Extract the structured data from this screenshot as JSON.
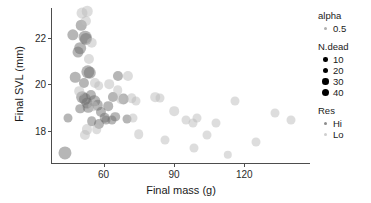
{
  "chart_data": {
    "type": "scatter",
    "title": "",
    "xlabel": "Final mass (g)",
    "ylabel": "Final SVL (mm)",
    "xlim": [
      38,
      148
    ],
    "ylim": [
      16.6,
      23.3
    ],
    "xticks": [
      60,
      90,
      120
    ],
    "yticks": [
      18,
      20,
      22
    ],
    "grid": false,
    "legend_position": "right",
    "point_color": "#7f7f7f",
    "alpha": 0.5,
    "encodings": {
      "size": "N.dead",
      "color": "Res"
    },
    "series": [
      {
        "name": "Hi",
        "color": "#6e6e6e",
        "points": [
          {
            "x": 47.0,
            "y": 22.15,
            "n": 18
          },
          {
            "x": 50.5,
            "y": 22.55,
            "n": 14
          },
          {
            "x": 52.0,
            "y": 22.05,
            "n": 26
          },
          {
            "x": 52.6,
            "y": 21.98,
            "n": 22
          },
          {
            "x": 50.0,
            "y": 21.55,
            "n": 20
          },
          {
            "x": 49.2,
            "y": 21.4,
            "n": 16
          },
          {
            "x": 48.0,
            "y": 20.3,
            "n": 14
          },
          {
            "x": 53.2,
            "y": 20.55,
            "n": 30
          },
          {
            "x": 54.0,
            "y": 20.5,
            "n": 24
          },
          {
            "x": 51.5,
            "y": 20.05,
            "n": 12
          },
          {
            "x": 51.0,
            "y": 19.45,
            "n": 20
          },
          {
            "x": 52.0,
            "y": 19.35,
            "n": 22
          },
          {
            "x": 52.8,
            "y": 19.2,
            "n": 16
          },
          {
            "x": 53.5,
            "y": 19.0,
            "n": 14
          },
          {
            "x": 50.0,
            "y": 18.95,
            "n": 10
          },
          {
            "x": 54.5,
            "y": 19.55,
            "n": 12
          },
          {
            "x": 56.0,
            "y": 19.3,
            "n": 18
          },
          {
            "x": 57.5,
            "y": 19.1,
            "n": 14
          },
          {
            "x": 59.0,
            "y": 18.8,
            "n": 12
          },
          {
            "x": 60.5,
            "y": 18.55,
            "n": 14
          },
          {
            "x": 62.0,
            "y": 19.05,
            "n": 10
          },
          {
            "x": 64.0,
            "y": 19.45,
            "n": 12
          },
          {
            "x": 66.0,
            "y": 20.35,
            "n": 12
          },
          {
            "x": 68.5,
            "y": 19.35,
            "n": 16
          },
          {
            "x": 65.0,
            "y": 18.6,
            "n": 10
          },
          {
            "x": 45.0,
            "y": 18.55,
            "n": 8
          },
          {
            "x": 43.5,
            "y": 17.05,
            "n": 28
          },
          {
            "x": 55.0,
            "y": 18.4,
            "n": 10
          },
          {
            "x": 58.0,
            "y": 18.3,
            "n": 12
          },
          {
            "x": 61.0,
            "y": 18.45,
            "n": 8
          },
          {
            "x": 63.5,
            "y": 18.45,
            "n": 8
          },
          {
            "x": 70.0,
            "y": 18.5,
            "n": 8
          }
        ]
      },
      {
        "name": "Lo",
        "color": "#bcbcbc",
        "points": [
          {
            "x": 51.0,
            "y": 23.1,
            "n": 16
          },
          {
            "x": 53.0,
            "y": 23.15,
            "n": 14
          },
          {
            "x": 52.5,
            "y": 22.75,
            "n": 12
          },
          {
            "x": 55.0,
            "y": 21.8,
            "n": 14
          },
          {
            "x": 53.8,
            "y": 21.1,
            "n": 12
          },
          {
            "x": 49.5,
            "y": 19.7,
            "n": 10
          },
          {
            "x": 56.5,
            "y": 20.05,
            "n": 12
          },
          {
            "x": 58.0,
            "y": 19.95,
            "n": 10
          },
          {
            "x": 55.5,
            "y": 19.05,
            "n": 10
          },
          {
            "x": 53.0,
            "y": 18.05,
            "n": 12
          },
          {
            "x": 52.2,
            "y": 17.8,
            "n": 12
          },
          {
            "x": 57.0,
            "y": 18.05,
            "n": 10
          },
          {
            "x": 62.5,
            "y": 20.0,
            "n": 10
          },
          {
            "x": 66.0,
            "y": 19.75,
            "n": 10
          },
          {
            "x": 67.5,
            "y": 19.35,
            "n": 10
          },
          {
            "x": 70.5,
            "y": 20.35,
            "n": 12
          },
          {
            "x": 72.0,
            "y": 19.4,
            "n": 10
          },
          {
            "x": 74.0,
            "y": 19.3,
            "n": 8
          },
          {
            "x": 72.5,
            "y": 18.55,
            "n": 8
          },
          {
            "x": 75.0,
            "y": 17.85,
            "n": 10
          },
          {
            "x": 82.0,
            "y": 19.45,
            "n": 10
          },
          {
            "x": 84.0,
            "y": 19.4,
            "n": 8
          },
          {
            "x": 86.0,
            "y": 17.6,
            "n": 8
          },
          {
            "x": 90.0,
            "y": 18.85,
            "n": 10
          },
          {
            "x": 95.0,
            "y": 18.45,
            "n": 8
          },
          {
            "x": 98.0,
            "y": 18.35,
            "n": 8
          },
          {
            "x": 100.0,
            "y": 18.55,
            "n": 8
          },
          {
            "x": 98.5,
            "y": 17.25,
            "n": 8
          },
          {
            "x": 104.0,
            "y": 17.8,
            "n": 8
          },
          {
            "x": 108.0,
            "y": 18.35,
            "n": 8
          },
          {
            "x": 113.0,
            "y": 16.95,
            "n": 6
          },
          {
            "x": 116.0,
            "y": 19.3,
            "n": 8
          },
          {
            "x": 125.0,
            "y": 17.5,
            "n": 8
          },
          {
            "x": 133.0,
            "y": 18.75,
            "n": 8
          },
          {
            "x": 140.0,
            "y": 18.45,
            "n": 8
          }
        ]
      }
    ]
  },
  "axes": {
    "x": {
      "label": "Final mass (g)",
      "ticks": [
        "60",
        "90",
        "120"
      ]
    },
    "y": {
      "label": "Final SVL (mm)",
      "ticks": [
        "22",
        "20",
        "18"
      ]
    }
  },
  "legend": {
    "alpha": {
      "title": "alpha",
      "items": [
        "0.5"
      ]
    },
    "ndead": {
      "title": "N.dead",
      "items": [
        "10",
        "20",
        "30",
        "40"
      ]
    },
    "res": {
      "title": "Res",
      "items": [
        "Hi",
        "Lo"
      ]
    }
  }
}
